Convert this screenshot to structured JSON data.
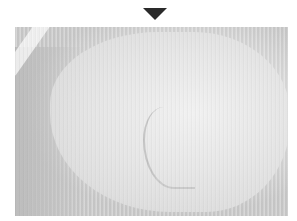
{
  "marker": {
    "shape": "down-triangle",
    "color": "#2a2a2a"
  },
  "photo": {
    "description": "Grayscale photograph of a pale, smooth curved surface with vertical scan-line texture",
    "tones": {
      "light": "#f4f4f4",
      "mid": "#e2e2e2",
      "dark": "#bdbdbd"
    }
  }
}
